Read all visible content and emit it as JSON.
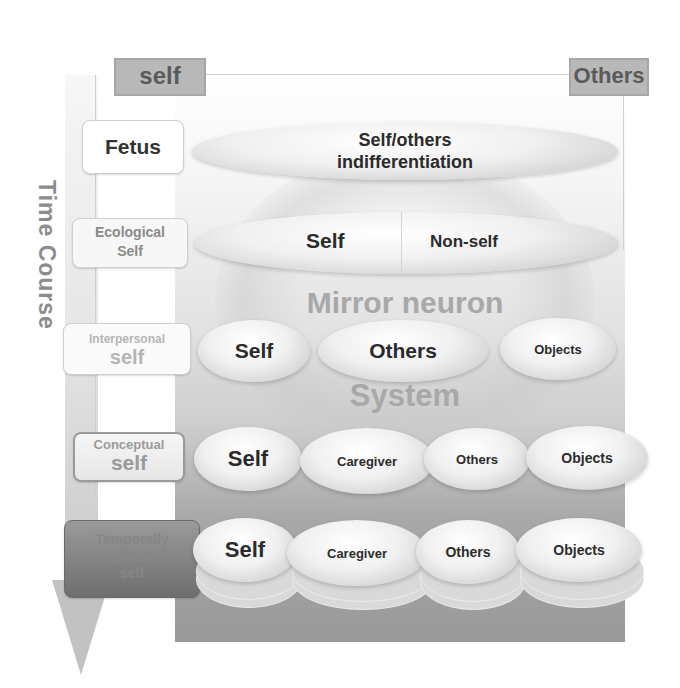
{
  "header": {
    "left_tag": "self",
    "right_tag": "Others"
  },
  "axis": {
    "label": "Time Course",
    "direction": "down"
  },
  "background_label": {
    "line1": "Mirror neuron",
    "line2": "System"
  },
  "stages": [
    {
      "id": "fetus",
      "label_line1": "Fetus",
      "label_line2": "",
      "ellipses": [
        {
          "text": "Self/others indifferentiation"
        }
      ]
    },
    {
      "id": "ecological",
      "label_line1": "Ecological",
      "label_line2": "Self",
      "ellipses": [
        {
          "text": "Self"
        },
        {
          "text": "Non-self"
        }
      ]
    },
    {
      "id": "interpersonal",
      "label_line1": "Interpersonal",
      "label_line2": "self",
      "ellipses": [
        {
          "text": "Self"
        },
        {
          "text": "Others"
        },
        {
          "text": "Objects"
        }
      ]
    },
    {
      "id": "conceptual",
      "label_line1": "Conceptual",
      "label_line2": "self",
      "ellipses": [
        {
          "text": "Self"
        },
        {
          "text": "Caregiver"
        },
        {
          "text": "Others"
        },
        {
          "text": "Objects"
        }
      ]
    },
    {
      "id": "temporally-expanded",
      "label_line1": "Temporally",
      "label_line2": "expanded",
      "label_line3": "self",
      "ellipses": [
        {
          "text": "Self"
        },
        {
          "text": "Caregiver"
        },
        {
          "text": "Others"
        },
        {
          "text": "Objects"
        }
      ]
    }
  ],
  "fetus_line1": "Self/others",
  "fetus_line2": "indifferentiation",
  "colors": {
    "panel_top": "#fbfbfb",
    "panel_bottom": "#999999",
    "tag_bg": "#b8b8b8",
    "text_dark": "#2b2b2b"
  }
}
